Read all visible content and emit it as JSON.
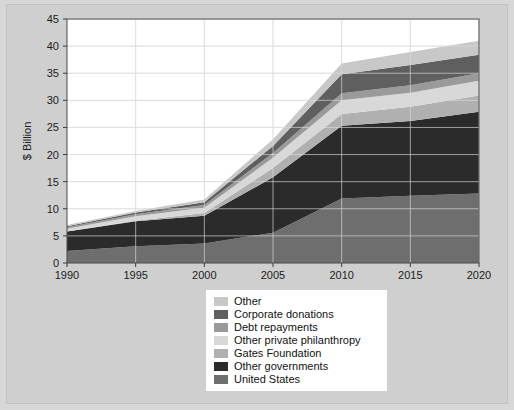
{
  "figure": {
    "background_color": "#cfcfcf",
    "plot_background_color": "#ffffff",
    "page_background_color": "#d7d7d7"
  },
  "chart_data": {
    "type": "area",
    "stacked": true,
    "title": "",
    "subtitle": "",
    "xlabel": "",
    "ylabel": "$ Billion",
    "x": [
      1990,
      1995,
      2000,
      2005,
      2010,
      2015,
      2020
    ],
    "xlim": [
      1990,
      2020
    ],
    "ylim": [
      0,
      45
    ],
    "xticks": [
      1990,
      1995,
      2000,
      2005,
      2010,
      2015,
      2020
    ],
    "xtick_labels": [
      "1990",
      "1995",
      "2000",
      "2005",
      "2010",
      "2015",
      "2020"
    ],
    "yticks": [
      0,
      5,
      10,
      15,
      20,
      25,
      30,
      35,
      40,
      45
    ],
    "ytick_labels": [
      "0",
      "5",
      "10",
      "15",
      "20",
      "25",
      "30",
      "35",
      "40",
      "45"
    ],
    "grid": true,
    "grid_color": "#e8e8e8",
    "legend_position": "below-center",
    "series": [
      {
        "name": "United States",
        "color": "#6e6e6e",
        "values": [
          2.2,
          3.1,
          3.6,
          5.6,
          11.9,
          12.4,
          12.8
        ]
      },
      {
        "name": "Other governments",
        "color": "#2b2b2b",
        "values": [
          3.6,
          4.6,
          5.1,
          10.2,
          13.4,
          13.8,
          15.1
        ]
      },
      {
        "name": "Gates Foundation",
        "color": "#b0b0b0",
        "values": [
          0.0,
          0.1,
          0.5,
          1.7,
          2.2,
          2.6,
          3.0
        ]
      },
      {
        "name": "Other private philanthropy",
        "color": "#d8d8d8",
        "values": [
          0.5,
          0.8,
          1.0,
          1.9,
          2.5,
          2.6,
          2.7
        ]
      },
      {
        "name": "Debt repayments",
        "color": "#9a9a9a",
        "values": [
          0.3,
          0.4,
          0.5,
          0.9,
          1.3,
          1.4,
          1.4
        ]
      },
      {
        "name": "Corporate donations",
        "color": "#5f5f5f",
        "values": [
          0.2,
          0.3,
          0.5,
          1.3,
          3.5,
          3.7,
          3.4
        ]
      },
      {
        "name": "Other",
        "color": "#c8c8c8",
        "values": [
          0.2,
          0.3,
          0.5,
          1.2,
          2.0,
          2.4,
          2.6
        ]
      }
    ],
    "totals": [
      7.0,
      9.6,
      11.7,
      22.8,
      36.8,
      38.9,
      41.0
    ]
  },
  "legend": {
    "items": [
      {
        "label": "Other",
        "color": "#c8c8c8"
      },
      {
        "label": "Corporate donations",
        "color": "#5f5f5f"
      },
      {
        "label": "Debt repayments",
        "color": "#9a9a9a"
      },
      {
        "label": "Other private philanthropy",
        "color": "#d8d8d8"
      },
      {
        "label": "Gates Foundation",
        "color": "#b0b0b0"
      },
      {
        "label": "Other governments",
        "color": "#2b2b2b"
      },
      {
        "label": "United States",
        "color": "#6e6e6e"
      }
    ]
  }
}
